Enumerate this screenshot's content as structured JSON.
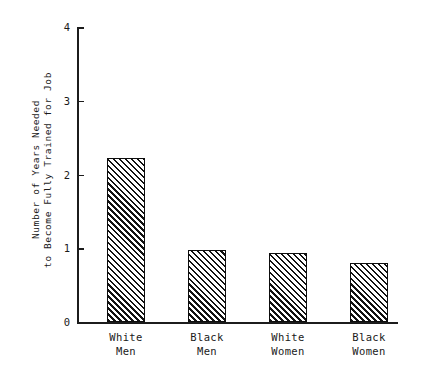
{
  "chart_data": {
    "type": "bar",
    "title": "",
    "subtitle": "",
    "xlabel": "",
    "ylabel": "Number of Years Needed to Become Fully Trained for Job",
    "ylabel_lines": [
      "Number of Years Needed",
      "to Become Fully Trained for Job"
    ],
    "categories": [
      "White Men",
      "Black Men",
      "White Women",
      "Black Women"
    ],
    "category_lines": [
      [
        "White",
        "Men"
      ],
      [
        "Black",
        "Men"
      ],
      [
        "White",
        "Women"
      ],
      [
        "Black",
        "Women"
      ]
    ],
    "values": [
      2.22,
      0.98,
      0.93,
      0.8
    ],
    "ylim": [
      0,
      4
    ],
    "yticks": [
      0,
      1,
      2,
      3,
      4
    ],
    "ytick_labels": [
      "0",
      "1",
      "2",
      "3",
      "4"
    ],
    "grid": false,
    "legend": false,
    "legend_position": "none",
    "bar_fill": "diagonal-hatch",
    "bar_edge_color": "#0d0d0d",
    "bar_hatch_color": "#121212",
    "background_color": "#ffffff",
    "axis_color": "#1c1c1c"
  }
}
